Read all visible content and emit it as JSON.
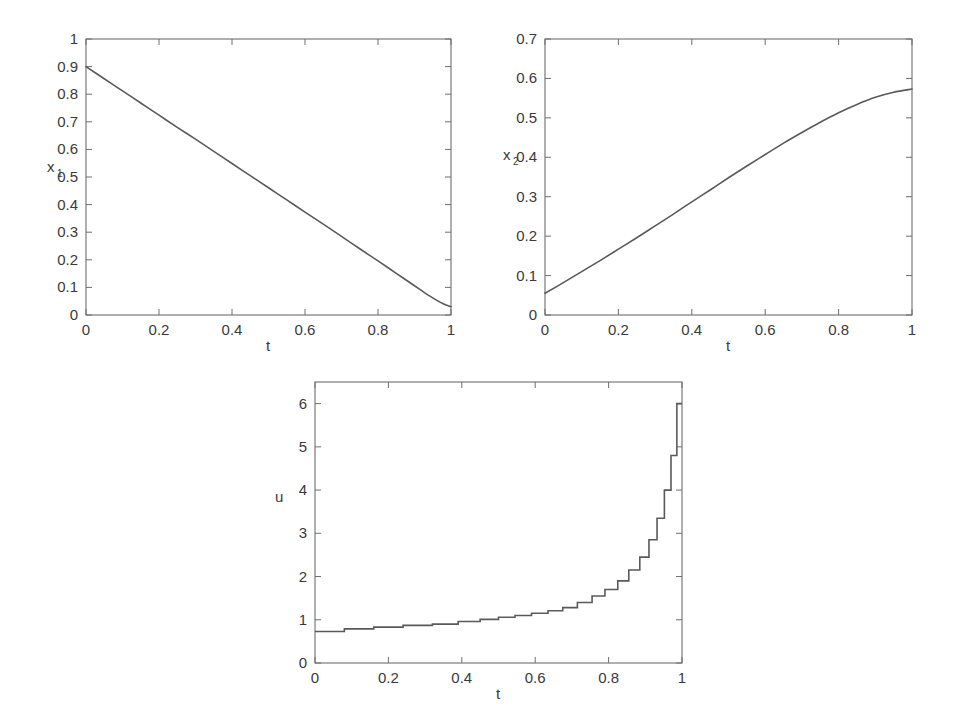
{
  "figure": {
    "background": "#ffffff",
    "line_color": "#5a5a5a",
    "axis_color": "#6e6e6e",
    "panel_count": 3
  },
  "panels": [
    {
      "id": "panel-x1",
      "name": "state-x1-plot",
      "ylabel_main": "x",
      "ylabel_sub": "1",
      "xlabel": "t"
    },
    {
      "id": "panel-x2",
      "name": "state-x2-plot",
      "ylabel_main": "x",
      "ylabel_sub": "2",
      "xlabel": "t"
    },
    {
      "id": "panel-u",
      "name": "control-u-plot",
      "ylabel_main": "u",
      "ylabel_sub": "",
      "xlabel": "t"
    }
  ],
  "chart_data": [
    {
      "type": "line",
      "id": "panel-x1",
      "title": "",
      "xlabel": "t",
      "ylabel": "x_1",
      "xlim": [
        0,
        1
      ],
      "ylim": [
        0,
        1
      ],
      "xticks": [
        0,
        0.2,
        0.4,
        0.6,
        0.8,
        1
      ],
      "xticklabels": [
        "0",
        "0.2",
        "0.4",
        "0.6",
        "0.8",
        "1"
      ],
      "yticks": [
        0,
        0.1,
        0.2,
        0.3,
        0.4,
        0.5,
        0.6,
        0.7,
        0.8,
        0.9,
        1
      ],
      "yticklabels": [
        "0",
        "0.1",
        "0.2",
        "0.3",
        "0.4",
        "0.5",
        "0.6",
        "0.7",
        "0.8",
        "0.9",
        "1"
      ],
      "grid": false,
      "legend": null,
      "series": [
        {
          "name": "x1",
          "x": [
            0,
            0.05,
            0.1,
            0.15,
            0.2,
            0.25,
            0.3,
            0.35,
            0.4,
            0.45,
            0.5,
            0.55,
            0.6,
            0.65,
            0.7,
            0.75,
            0.8,
            0.85,
            0.9,
            0.92,
            0.94,
            0.96,
            0.98,
            1
          ],
          "y": [
            0.9,
            0.856,
            0.812,
            0.768,
            0.724,
            0.68,
            0.637,
            0.593,
            0.549,
            0.505,
            0.461,
            0.417,
            0.373,
            0.329,
            0.285,
            0.24,
            0.196,
            0.151,
            0.106,
            0.088,
            0.07,
            0.054,
            0.04,
            0.03
          ]
        }
      ]
    },
    {
      "type": "line",
      "id": "panel-x2",
      "title": "",
      "xlabel": "t",
      "ylabel": "x_2",
      "xlim": [
        0,
        1
      ],
      "ylim": [
        0,
        0.7
      ],
      "xticks": [
        0,
        0.2,
        0.4,
        0.6,
        0.8,
        1
      ],
      "xticklabels": [
        "0",
        "0.2",
        "0.4",
        "0.6",
        "0.8",
        "1"
      ],
      "yticks": [
        0,
        0.1,
        0.2,
        0.3,
        0.4,
        0.5,
        0.6,
        0.7
      ],
      "yticklabels": [
        "0",
        "0.1",
        "0.2",
        "0.3",
        "0.4",
        "0.5",
        "0.6",
        "0.7"
      ],
      "grid": false,
      "legend": null,
      "series": [
        {
          "name": "x2",
          "x": [
            0,
            0.05,
            0.1,
            0.15,
            0.2,
            0.25,
            0.3,
            0.35,
            0.4,
            0.45,
            0.5,
            0.55,
            0.6,
            0.65,
            0.7,
            0.75,
            0.8,
            0.85,
            0.9,
            0.95,
            1
          ],
          "y": [
            0.055,
            0.082,
            0.11,
            0.138,
            0.167,
            0.196,
            0.226,
            0.256,
            0.287,
            0.317,
            0.348,
            0.378,
            0.407,
            0.436,
            0.463,
            0.489,
            0.513,
            0.534,
            0.552,
            0.565,
            0.573
          ]
        }
      ]
    },
    {
      "type": "line",
      "id": "panel-u",
      "title": "",
      "xlabel": "t",
      "ylabel": "u",
      "xlim": [
        0,
        1
      ],
      "ylim": [
        0,
        6.5
      ],
      "xticks": [
        0,
        0.2,
        0.4,
        0.6,
        0.8,
        1
      ],
      "xticklabels": [
        "0",
        "0.2",
        "0.4",
        "0.6",
        "0.8",
        "1"
      ],
      "yticks": [
        0,
        1,
        2,
        3,
        4,
        5,
        6
      ],
      "yticklabels": [
        "0",
        "1",
        "2",
        "3",
        "4",
        "5",
        "6"
      ],
      "grid": false,
      "legend": null,
      "step_style": "post",
      "series": [
        {
          "name": "u",
          "x": [
            0.0,
            0.08,
            0.16,
            0.24,
            0.32,
            0.39,
            0.45,
            0.5,
            0.545,
            0.59,
            0.635,
            0.675,
            0.715,
            0.755,
            0.79,
            0.825,
            0.855,
            0.885,
            0.91,
            0.932,
            0.952,
            0.97,
            0.986,
            1.0
          ],
          "y": [
            0.73,
            0.79,
            0.83,
            0.87,
            0.9,
            0.96,
            1.01,
            1.06,
            1.1,
            1.15,
            1.21,
            1.28,
            1.4,
            1.55,
            1.7,
            1.9,
            2.15,
            2.45,
            2.85,
            3.35,
            4.0,
            4.8,
            6.0,
            6.0
          ]
        }
      ]
    }
  ]
}
